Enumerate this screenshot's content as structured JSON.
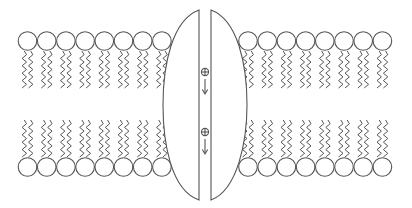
{
  "diagram": {
    "type": "ion-channel-membrane",
    "colors": {
      "stroke": "#555555",
      "background": "#ffffff"
    },
    "membrane": {
      "left_segment": {
        "top_leaflet_heads": 8,
        "bottom_leaflet_heads": 8
      },
      "right_segment": {
        "top_leaflet_heads": 8,
        "bottom_leaflet_heads": 8
      }
    },
    "channel": {
      "halves": 2,
      "ions": [
        {
          "symbol": "⊕",
          "direction": "down"
        },
        {
          "symbol": "⊕",
          "direction": "down"
        }
      ]
    }
  }
}
